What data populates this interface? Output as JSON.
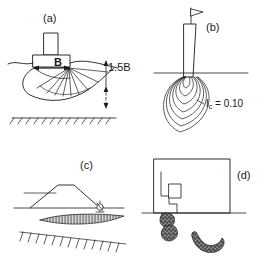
{
  "figure": {
    "background_color": "#ffffff",
    "line_color": "#1a1a1a",
    "fill_color": "#ffffff",
    "width_px": 273,
    "height_px": 268
  },
  "panels": [
    {
      "id": "a",
      "label": "(a)",
      "subject": "shallow strip footing with bulb of pressure",
      "annotations": {
        "footing_width_label": "B",
        "influence_depth_label": "1.5B"
      },
      "features": [
        "column",
        "footing-pad",
        "ground-surface-line",
        "pressure-bulb",
        "radial-shear-fan",
        "width-dimension-arrow",
        "depth-dimension-arrow",
        "rigid-base-hatching"
      ]
    },
    {
      "id": "b",
      "label": "(b)",
      "subject": "driven pile with stress contours at the toe",
      "annotations": {
        "contour_label_symbol": "I",
        "contour_label_subscript": "c",
        "contour_label_equals": " = 0.10",
        "contour_label_full": "Ic = 0.10"
      },
      "contour_count": 7,
      "features": [
        "flag",
        "pile-shaft",
        "ground-surface-line",
        "stress-contours",
        "contour-leader-line"
      ]
    },
    {
      "id": "c",
      "label": "(c)",
      "subject": "embankment on soft ground with lens-shaped shear zone",
      "annotations": {},
      "features": [
        "embankment",
        "original-ground-line",
        "ground-surface-line",
        "shear-lens",
        "instrument-marker",
        "rigid-base-hatching"
      ]
    },
    {
      "id": "d",
      "label": "(d)",
      "subject": "retaining structure / excavation with stepped profile and failure blocks",
      "annotations": {},
      "features": [
        "boundary-rectangle",
        "stepped-wall-profile",
        "ground-surface-line",
        "failure-block-upper",
        "failure-block-lower"
      ]
    }
  ]
}
